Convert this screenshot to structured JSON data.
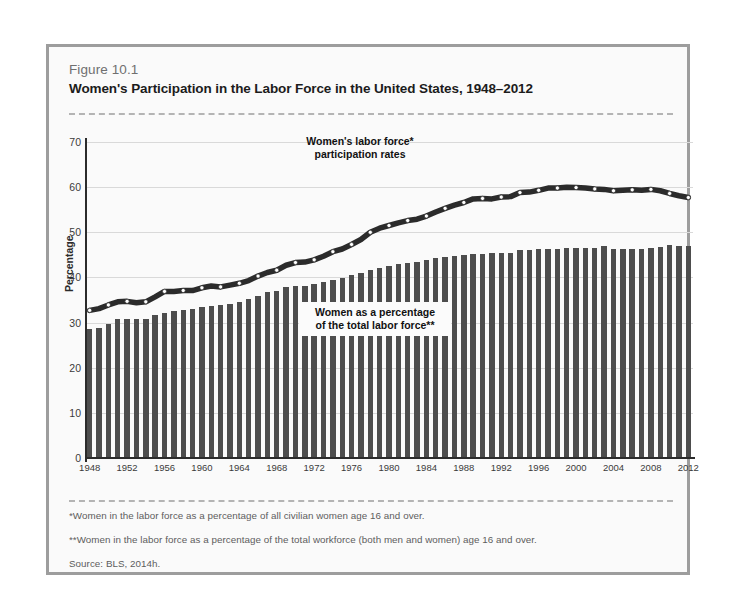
{
  "figure": {
    "number": "Figure 10.1",
    "title": "Women's Participation in the Labor Force in the United States, 1948–2012"
  },
  "notes": {
    "note1": "*Women in the labor force as a percentage of all civilian women age 16 and over.",
    "note2": "**Women in the labor force as a percentage of the total workforce (both men and women) age 16 and over.",
    "source": "Source: BLS, 2014h."
  },
  "annotations": {
    "line_label": "Women's labor force*\nparticipation rates",
    "line_label_l1": "Women's labor force*",
    "line_label_l2": "participation rates",
    "bar_label_l1": "Women as a percentage",
    "bar_label_l2": "of the total labor force**"
  },
  "colors": {
    "bar": "#4d4d4d",
    "line": "#2b2b2b",
    "marker_fill": "#ffffff",
    "panel_bg": "#fafafa",
    "panel_border": "#9d9d9d",
    "grid": "#d9d9d9"
  },
  "chart_data": {
    "type": "bar",
    "title": "Women's Participation in the Labor Force in the United States, 1948–2012",
    "xlabel": "",
    "ylabel": "Percentage",
    "ylim": [
      0,
      70
    ],
    "yticks": [
      0,
      10,
      20,
      30,
      40,
      50,
      60,
      70
    ],
    "grid": true,
    "legend": "annotations",
    "x": [
      1948,
      1949,
      1950,
      1951,
      1952,
      1953,
      1954,
      1955,
      1956,
      1957,
      1958,
      1959,
      1960,
      1961,
      1962,
      1963,
      1964,
      1965,
      1966,
      1967,
      1968,
      1969,
      1970,
      1971,
      1972,
      1973,
      1974,
      1975,
      1976,
      1977,
      1978,
      1979,
      1980,
      1981,
      1982,
      1983,
      1984,
      1985,
      1986,
      1987,
      1988,
      1989,
      1990,
      1991,
      1992,
      1993,
      1994,
      1995,
      1996,
      1997,
      1998,
      1999,
      2000,
      2001,
      2002,
      2003,
      2004,
      2005,
      2006,
      2007,
      2008,
      2009,
      2010,
      2011,
      2012
    ],
    "xtick_labels": [
      "1948",
      "1952",
      "1956",
      "1960",
      "1964",
      "1968",
      "1972",
      "1976",
      "1980",
      "1984",
      "1988",
      "1992",
      "1996",
      "2000",
      "2004",
      "2008",
      "2012"
    ],
    "series": [
      {
        "name": "Women as a percentage of the total labor force**",
        "type": "bar",
        "values": [
          28.6,
          28.9,
          29.6,
          30.8,
          30.8,
          30.8,
          30.9,
          31.6,
          32.2,
          32.5,
          32.7,
          32.9,
          33.4,
          33.7,
          33.9,
          34.1,
          34.5,
          35.2,
          36.0,
          36.7,
          37.1,
          37.8,
          38.1,
          38.2,
          38.5,
          38.9,
          39.4,
          39.9,
          40.5,
          41.0,
          41.7,
          42.1,
          42.5,
          43.0,
          43.3,
          43.5,
          43.8,
          44.2,
          44.5,
          44.8,
          45.0,
          45.2,
          45.2,
          45.4,
          45.5,
          45.5,
          46.0,
          46.1,
          46.2,
          46.2,
          46.3,
          46.5,
          46.6,
          46.6,
          46.5,
          47.0,
          46.4,
          46.4,
          46.3,
          46.4,
          46.5,
          46.8,
          47.2,
          47.0,
          46.9
        ]
      },
      {
        "name": "Women's labor force* participation rates",
        "type": "line",
        "values": [
          32.7,
          33.1,
          33.9,
          34.6,
          34.7,
          34.4,
          34.6,
          35.7,
          36.9,
          36.9,
          37.1,
          37.1,
          37.7,
          38.1,
          37.9,
          38.3,
          38.7,
          39.3,
          40.3,
          41.1,
          41.6,
          42.7,
          43.3,
          43.4,
          43.9,
          44.7,
          45.7,
          46.3,
          47.3,
          48.4,
          50.0,
          50.9,
          51.5,
          52.1,
          52.6,
          52.9,
          53.6,
          54.5,
          55.3,
          56.0,
          56.6,
          57.4,
          57.5,
          57.4,
          57.8,
          57.9,
          58.8,
          58.9,
          59.3,
          59.8,
          59.8,
          60.0,
          59.9,
          59.8,
          59.6,
          59.5,
          59.2,
          59.3,
          59.4,
          59.3,
          59.5,
          59.2,
          58.6,
          58.1,
          57.7
        ]
      }
    ]
  }
}
